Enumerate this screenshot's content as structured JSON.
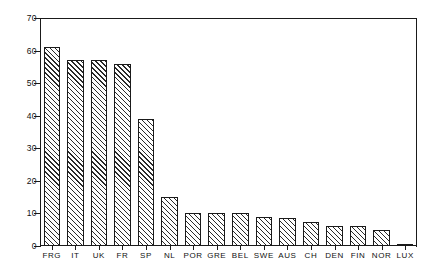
{
  "chart_data": {
    "type": "bar",
    "title": "",
    "subtitle": "",
    "xlabel": "",
    "ylabel": "",
    "categories": [
      "FRG",
      "IT",
      "UK",
      "FR",
      "SP",
      "NL",
      "POR",
      "GRE",
      "BEL",
      "SWE",
      "AUS",
      "CH",
      "DEN",
      "FIN",
      "NOR",
      "LUX"
    ],
    "values": [
      61,
      57,
      57,
      56,
      39,
      15,
      10,
      10,
      10,
      9,
      8.5,
      7.5,
      6,
      6,
      5,
      0.5
    ],
    "ylim": [
      0,
      70
    ],
    "yticks": [
      0,
      10,
      20,
      30,
      40,
      50,
      60,
      70
    ],
    "ytick_labels": [
      "0",
      "10",
      "20",
      "30",
      "40",
      "50",
      "60",
      "70"
    ],
    "xlim": [
      0,
      16
    ],
    "grid": false,
    "legend": null,
    "legend_position": "none",
    "bar_fill": "hatch-diagonal-forward",
    "bar_edge_color": "#1a1a1a",
    "background_color": "#ffffff",
    "annotations": []
  }
}
